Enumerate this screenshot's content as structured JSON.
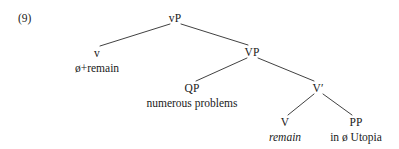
{
  "figure": {
    "example_number": "(9)",
    "type": "syntax-tree",
    "line_color": "#2b2b2b",
    "text_color": "#1a1a1a",
    "background_color": "#ffffff"
  },
  "nodes": [
    {
      "id": "vP",
      "label": "vP",
      "x": 175,
      "y": 18,
      "terminal": null,
      "italic": false
    },
    {
      "id": "v",
      "label": "v",
      "x": 97,
      "y": 53,
      "terminal": "ø+remain",
      "italic": false
    },
    {
      "id": "VP",
      "label": "VP",
      "x": 252,
      "y": 52,
      "terminal": null,
      "italic": false
    },
    {
      "id": "QP",
      "label": "QP",
      "x": 192,
      "y": 88,
      "terminal": "numerous problems",
      "italic": false
    },
    {
      "id": "Vbar",
      "label": "V′",
      "x": 318,
      "y": 88,
      "terminal": null,
      "italic": false
    },
    {
      "id": "V",
      "label": "V",
      "x": 285,
      "y": 122,
      "terminal": "remain",
      "italic": true
    },
    {
      "id": "PP",
      "label": "PP",
      "x": 356,
      "y": 122,
      "terminal": "in ø Utopia",
      "italic": false
    }
  ],
  "edges": [
    {
      "from": "vP",
      "to": "v",
      "x1": 170,
      "y1": 24,
      "x2": 100,
      "y2": 46
    },
    {
      "from": "vP",
      "to": "VP",
      "x1": 181,
      "y1": 24,
      "x2": 248,
      "y2": 45
    },
    {
      "from": "VP",
      "to": "QP",
      "x1": 247,
      "y1": 58,
      "x2": 196,
      "y2": 81
    },
    {
      "from": "VP",
      "to": "Vbar",
      "x1": 258,
      "y1": 58,
      "x2": 314,
      "y2": 81
    },
    {
      "from": "Vbar",
      "to": "V",
      "x1": 314,
      "y1": 94,
      "x2": 288,
      "y2": 115
    },
    {
      "from": "Vbar",
      "to": "PP",
      "x1": 323,
      "y1": 94,
      "x2": 352,
      "y2": 115
    }
  ]
}
